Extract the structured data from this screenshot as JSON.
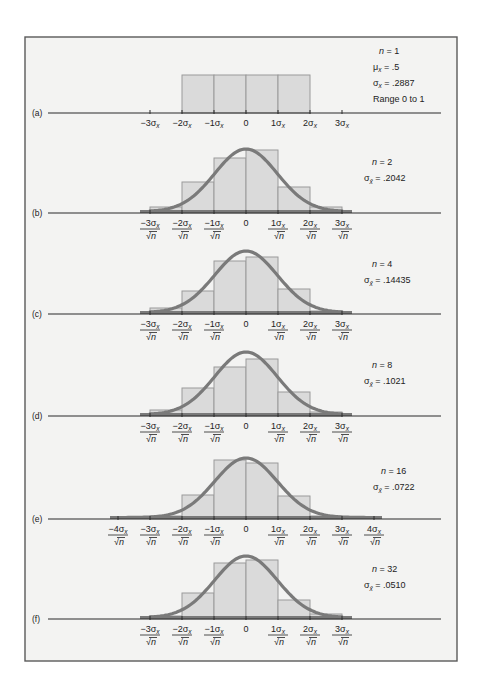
{
  "chart_data": [
    {
      "panel": "(a)",
      "type": "bar",
      "stats": [
        "n = 1",
        "μx = .5",
        "σx = .2887",
        "Range 0 to 1"
      ],
      "n": 1,
      "mean": 0.5,
      "sigma": 0.2887,
      "range": [
        0,
        1
      ],
      "tick_labels": [
        "−3σx",
        "−2σx",
        "−1σx",
        "0",
        "1σx",
        "2σx",
        "3σx"
      ],
      "tick_style": "plain",
      "bin_edges_sigma": [
        -2,
        -1,
        0,
        1,
        2
      ],
      "values": [
        0.25,
        0.25,
        0.25,
        0.25
      ],
      "normal_curve": false
    },
    {
      "panel": "(b)",
      "type": "bar",
      "stats": [
        "n = 2",
        "σx̄ = .2042"
      ],
      "n": 2,
      "sigma_xbar": 0.2042,
      "tick_labels": [
        "−3σx/√n",
        "−2σx/√n",
        "−1σx/√n",
        "0",
        "1σx/√n",
        "2σx/√n",
        "3σx/√n"
      ],
      "tick_style": "fraction",
      "bin_edges_sigma": [
        -3,
        -2,
        -1,
        0,
        1,
        2,
        3
      ],
      "values": [
        0.02,
        0.125,
        0.235,
        0.27,
        0.11,
        0.02
      ],
      "normal_curve": true
    },
    {
      "panel": "(c)",
      "type": "bar",
      "stats": [
        "n = 4",
        "σx̄ = .14435"
      ],
      "n": 4,
      "sigma_xbar": 0.14435,
      "tick_labels": [
        "−3σx/√n",
        "−2σx/√n",
        "−1σx/√n",
        "0",
        "1σx/√n",
        "2σx/√n",
        "3σx/√n"
      ],
      "tick_style": "fraction",
      "bin_edges_sigma": [
        -3,
        -2,
        -1,
        0,
        1,
        2,
        3
      ],
      "values": [
        0.025,
        0.115,
        0.255,
        0.27,
        0.12,
        0.01
      ],
      "normal_curve": true
    },
    {
      "panel": "(d)",
      "type": "bar",
      "stats": [
        "n = 8",
        "σx̄ = .1021"
      ],
      "n": 8,
      "sigma_xbar": 0.1021,
      "tick_labels": [
        "−3σx/√n",
        "−2σx/√n",
        "−1σx/√n",
        "0",
        "1σx/√n",
        "2σx/√n",
        "3σx/√n"
      ],
      "tick_style": "fraction",
      "bin_edges_sigma": [
        -3,
        -2,
        -1,
        0,
        1,
        2,
        3
      ],
      "values": [
        0.025,
        0.14,
        0.245,
        0.285,
        0.12,
        0.02
      ],
      "normal_curve": true
    },
    {
      "panel": "(e)",
      "type": "bar",
      "stats": [
        "n = 16",
        "σx̄ = .0722"
      ],
      "n": 16,
      "sigma_xbar": 0.0722,
      "tick_labels": [
        "−4σx/√n",
        "−3σx/√n",
        "−2σx/√n",
        "−1σx/√n",
        "0",
        "1σx/√n",
        "2σx/√n",
        "3σx/√n",
        "4σx/√n"
      ],
      "tick_style": "fraction",
      "bin_edges_sigma": [
        -3,
        -2,
        -1,
        0,
        1,
        2,
        3
      ],
      "values": [
        0.015,
        0.12,
        0.295,
        0.28,
        0.115,
        0.015
      ],
      "normal_curve": true
    },
    {
      "panel": "(f)",
      "type": "bar",
      "stats": [
        "n = 32",
        "σx̄ = .0510"
      ],
      "n": 32,
      "sigma_xbar": 0.051,
      "tick_labels": [
        "−3σx/√n",
        "−2σx/√n",
        "−1σx/√n",
        "0",
        "1σx/√n",
        "2σx/√n",
        "3σx/√n"
      ],
      "tick_style": "fraction",
      "bin_edges_sigma": [
        -3,
        -2,
        -1,
        0,
        1,
        2,
        3
      ],
      "values": [
        0.015,
        0.125,
        0.275,
        0.29,
        0.09,
        0.025
      ],
      "normal_curve": true
    }
  ],
  "figure": {
    "panel_labels": [
      "(a)",
      "(b)",
      "(c)",
      "(d)",
      "(e)",
      "(f)"
    ],
    "colors": {
      "background": "#f3f3f2",
      "frame": "#5a5a5a",
      "bar_fill": "#dadada",
      "bar_edge": "#9a9a9a",
      "curve": "#7a7a7a",
      "axis": "#2b2b2b"
    }
  },
  "layout": {
    "frame": {
      "x": 25,
      "y": 37,
      "w": 432,
      "h": 624
    },
    "axis_x0": 48,
    "axis_x1": 441,
    "center_x": 246,
    "unit_px": 32,
    "panels": [
      {
        "axis_y": 113,
        "bar_tops": [
          75,
          75,
          75,
          75
        ],
        "curve_peak_y": null,
        "ticks_range": [
          -3,
          3
        ],
        "tail": null
      },
      {
        "axis_y": 213,
        "bar_tops": [
          207,
          182,
          158,
          150,
          187,
          207
        ],
        "curve_peak_y": 149,
        "ticks_range": [
          -3,
          3
        ],
        "tail": [
          140,
          352
        ]
      },
      {
        "axis_y": 314,
        "bar_tops": [
          308,
          291,
          261,
          257,
          289,
          311
        ],
        "curve_peak_y": 251,
        "ticks_range": [
          -3,
          3
        ],
        "tail": [
          140,
          352
        ]
      },
      {
        "axis_y": 416,
        "bar_tops": [
          410,
          388,
          367,
          359,
          392,
          412
        ],
        "curve_peak_y": 352,
        "ticks_range": [
          -3,
          3
        ],
        "tail": [
          140,
          352
        ]
      },
      {
        "axis_y": 519,
        "bar_tops": [
          516,
          495,
          460,
          463,
          496,
          516
        ],
        "curve_peak_y": 458,
        "ticks_range": [
          -4,
          4
        ],
        "tail": [
          110,
          382
        ]
      },
      {
        "axis_y": 619,
        "bar_tops": [
          616,
          593,
          563,
          560,
          600,
          614
        ],
        "curve_peak_y": 556,
        "ticks_range": [
          -3,
          3
        ],
        "tail": [
          140,
          352
        ]
      }
    ]
  }
}
